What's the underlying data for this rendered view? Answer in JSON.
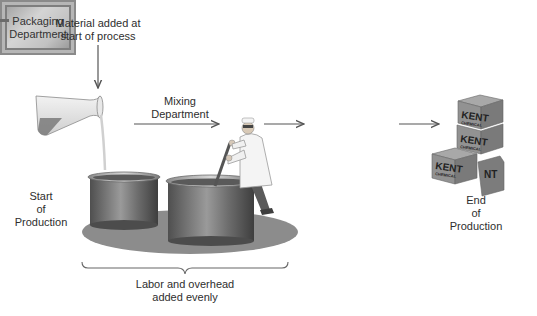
{
  "diagram": {
    "labels": {
      "material_added": [
        "Material added at",
        "start of process"
      ],
      "mixing_department": [
        "Mixing",
        "Department"
      ],
      "packaging_department": [
        "Packaging",
        "Department"
      ],
      "start_of_production": [
        "Start",
        "of",
        "Production"
      ],
      "end_of_production": [
        "End",
        "of",
        "Production"
      ],
      "labor_overhead": [
        "Labor and overhead",
        "added evenly"
      ]
    },
    "box_brand": [
      "KENT",
      "CHEMICAL"
    ],
    "colors": {
      "arrow": "#555555",
      "vat": "#6e6e6e",
      "shadow": "#8c8c8c",
      "packaging_box": "#c4c4c4",
      "crate": "#8f8f8f",
      "liquid": "#7a7a7a"
    }
  }
}
